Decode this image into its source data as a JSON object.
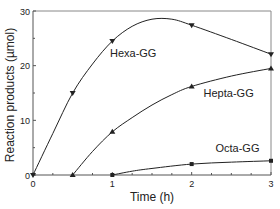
{
  "chart_data": {
    "type": "line",
    "title": "",
    "xlabel": "Time (h)",
    "ylabel": "Reaction products (µmol)",
    "xlim": [
      0,
      3
    ],
    "ylim": [
      0,
      30
    ],
    "xticks": [
      0,
      1,
      2,
      3
    ],
    "yticks": [
      0,
      10,
      20,
      30
    ],
    "grid": false,
    "legend": "inline labels",
    "series": [
      {
        "name": "Hexa-GG",
        "marker": "triangle-down",
        "x": [
          0,
          0.5,
          1,
          2,
          3
        ],
        "y": [
          0,
          15,
          24.5,
          27.4,
          22.1
        ],
        "curve": [
          [
            0,
            0
          ],
          [
            0.25,
            7.6
          ],
          [
            0.5,
            15
          ],
          [
            0.75,
            20.3
          ],
          [
            1,
            24.5
          ],
          [
            1.25,
            27.2
          ],
          [
            1.5,
            28.5
          ],
          [
            1.75,
            28.5
          ],
          [
            2,
            27.4
          ],
          [
            2.5,
            24.8
          ],
          [
            3,
            22.1
          ]
        ],
        "label_pos": [
          0.97,
          21.5
        ]
      },
      {
        "name": "Hepta-GG",
        "marker": "triangle-up",
        "x": [
          0.5,
          1,
          2,
          3
        ],
        "y": [
          0,
          7.9,
          16.2,
          19.5
        ],
        "curve": [
          [
            0.5,
            0
          ],
          [
            0.75,
            4.3
          ],
          [
            1,
            7.9
          ],
          [
            1.25,
            10.5
          ],
          [
            1.5,
            12.8
          ],
          [
            1.75,
            14.7
          ],
          [
            2,
            16.2
          ],
          [
            2.5,
            18.1
          ],
          [
            3,
            19.5
          ]
        ],
        "label_pos": [
          2.15,
          14.2
        ]
      },
      {
        "name": "Octa-GG",
        "marker": "square",
        "x": [
          1,
          2,
          3
        ],
        "y": [
          0,
          2,
          2.6
        ],
        "curve": [
          [
            1,
            0
          ],
          [
            1.25,
            0.7
          ],
          [
            1.5,
            1.2
          ],
          [
            2,
            2
          ],
          [
            2.5,
            2.35
          ],
          [
            3,
            2.6
          ]
        ],
        "label_pos": [
          2.3,
          4.2
        ]
      }
    ]
  },
  "labels": {
    "xlabel": "Time (h)",
    "ylabel": "Reaction products (µmol)",
    "xtick_labels": [
      "0",
      "1",
      "2",
      "3"
    ],
    "ytick_labels": [
      "0",
      "10",
      "20",
      "30"
    ],
    "series_labels": [
      "Hexa-GG",
      "Hepta-GG",
      "Octa-GG"
    ]
  },
  "colors": {
    "line": "#222222",
    "axis": "#555555",
    "frame": "#888888"
  }
}
